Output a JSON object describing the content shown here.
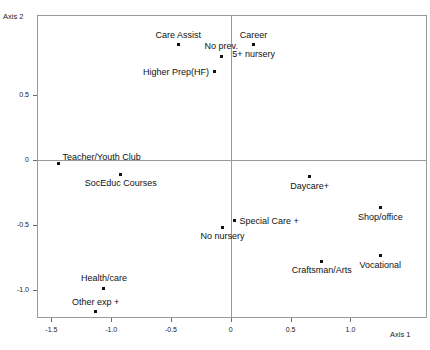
{
  "chart_data": {
    "type": "scatter",
    "title": "",
    "xlabel": "Axis 1",
    "ylabel": "Axis 2",
    "xlim": [
      -1.62,
      1.64
    ],
    "ylim": [
      -1.22,
      1.12
    ],
    "xticks": [
      -1.5,
      -1.0,
      -0.5,
      0,
      0.5,
      1.0
    ],
    "xticklabels": [
      "-1.5",
      "-1.0",
      "-0.5",
      "0",
      "0.5",
      "1.0"
    ],
    "yticks": [
      0.5,
      0,
      -0.5,
      -1.0
    ],
    "yticklabels": [
      "0.5",
      "0",
      "-0.5",
      "-1.0"
    ],
    "grid": false,
    "legend": null,
    "zero_lines": {
      "x": 0,
      "y": 0
    },
    "points": [
      {
        "label": "Care Assist",
        "x": -0.44,
        "y": 0.89,
        "label_pos": "above"
      },
      {
        "label": "No prev.",
        "x": -0.08,
        "y": 0.8,
        "label_pos": "above"
      },
      {
        "label": "Career",
        "x": 0.19,
        "y": 0.89,
        "label_pos": "above"
      },
      {
        "label": "5+ nursery",
        "x": 0.19,
        "y": 0.89,
        "label_pos": "below"
      },
      {
        "label": "Higher Prep(HF)",
        "x": -0.14,
        "y": 0.68,
        "label_pos": "left"
      },
      {
        "label": "Teacher/Youth Club",
        "x": -1.44,
        "y": -0.03,
        "label_pos": "above-right"
      },
      {
        "label": "SocEduc Courses",
        "x": -0.92,
        "y": -0.11,
        "label_pos": "below"
      },
      {
        "label": "Daycare+",
        "x": 0.66,
        "y": -0.13,
        "label_pos": "below"
      },
      {
        "label": "Special Care +",
        "x": 0.03,
        "y": -0.47,
        "label_pos": "right"
      },
      {
        "label": "Shop/office",
        "x": 1.25,
        "y": -0.37,
        "label_pos": "below"
      },
      {
        "label": "No nursery",
        "x": -0.07,
        "y": -0.52,
        "label_pos": "below"
      },
      {
        "label": "Vocational",
        "x": 1.25,
        "y": -0.74,
        "label_pos": "below"
      },
      {
        "label": "Craftsman/Arts",
        "x": 0.76,
        "y": -0.78,
        "label_pos": "below"
      },
      {
        "label": "Health/care",
        "x": -1.06,
        "y": -0.99,
        "label_pos": "above"
      },
      {
        "label": "Other exp +",
        "x": -1.13,
        "y": -1.17,
        "label_pos": "above"
      }
    ]
  }
}
